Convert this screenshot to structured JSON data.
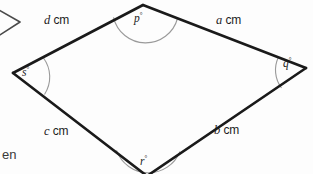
{
  "figure": {
    "type": "quadrilateral",
    "stroke_color": "#1a1a1a",
    "arc_color": "#8c8c8c",
    "background_color": "#fdfdfd",
    "vertices": [
      {
        "name": "top",
        "x": 143,
        "y": 5
      },
      {
        "name": "right",
        "x": 306,
        "y": 68
      },
      {
        "name": "bottom",
        "x": 147,
        "y": 173
      },
      {
        "name": "left",
        "x": 13,
        "y": 73
      }
    ],
    "sides": [
      {
        "id": "a",
        "label_var": "a",
        "label_unit": "cm",
        "from": "top",
        "to": "right"
      },
      {
        "id": "b",
        "label_var": "b",
        "label_unit": "cm",
        "from": "right",
        "to": "bottom"
      },
      {
        "id": "c",
        "label_var": "c",
        "label_unit": "cm",
        "from": "bottom",
        "to": "left"
      },
      {
        "id": "d",
        "label_var": "d",
        "label_unit": "cm",
        "from": "left",
        "to": "top"
      }
    ],
    "angles": [
      {
        "id": "p",
        "label_var": "p",
        "degree_symbol": "°",
        "at_vertex": "top"
      },
      {
        "id": "q",
        "label_var": "q",
        "degree_symbol": "°",
        "at_vertex": "right"
      },
      {
        "id": "r",
        "label_var": "r",
        "degree_symbol": "°",
        "at_vertex": "bottom"
      },
      {
        "id": "s",
        "label_var": "s",
        "degree_symbol": "°",
        "at_vertex": "left"
      }
    ]
  },
  "labels": {
    "side_a": "a",
    "side_b": "b",
    "side_c": "c",
    "side_d": "d",
    "unit": "cm",
    "angle_p": "p",
    "angle_q": "q",
    "angle_r": "r",
    "angle_s": "s",
    "degree": "°"
  },
  "fragments": {
    "bottom_left_text": "en",
    "top_left_icon": "chevron-right-marker"
  }
}
